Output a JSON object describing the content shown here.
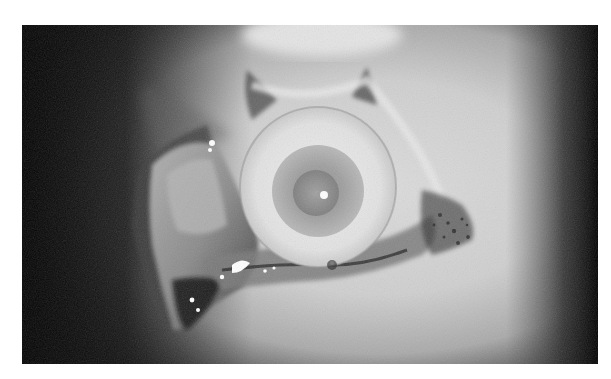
{
  "image": {
    "kind": "photograph",
    "style": "grayscale",
    "subject": "close-up clinical photograph of an eye with surrounding surgically retracted tissue",
    "frame": {
      "x": 22,
      "y": 25,
      "width": 576,
      "height": 339,
      "border_color": "#ffffff"
    },
    "colors": {
      "background_border": "#ffffff",
      "dark_vignette": "#050505",
      "skin_light": "#d8d8d8",
      "skin_mid": "#a8a8a8",
      "sclera": "#e6e6e6",
      "iris": "#9a9a9a",
      "pupil": "#8a8a8a",
      "highlight": "#ffffff",
      "tissue_dark": "#2a2a2a"
    },
    "elements": [
      {
        "name": "eyeball",
        "center": [
          296,
          165
        ],
        "radius": 75
      },
      {
        "name": "iris",
        "center": [
          296,
          168
        ],
        "radius": 45
      },
      {
        "name": "pupil",
        "center": [
          295,
          170
        ],
        "radius": 22
      },
      {
        "name": "corneal-reflection",
        "center": [
          302,
          170
        ],
        "radius": 4
      },
      {
        "name": "everted-lower-flap",
        "region": "lower-left"
      },
      {
        "name": "pigmented-tissue",
        "region": "right of eyeball"
      }
    ]
  }
}
